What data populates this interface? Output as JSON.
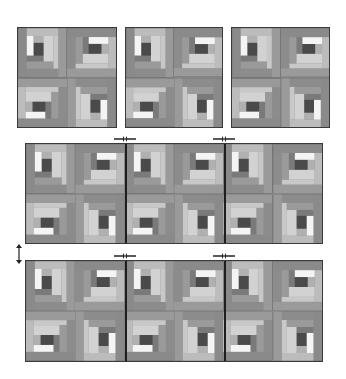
{
  "diagram": {
    "title": "",
    "colors": {
      "center": "#4a4a4a",
      "white": "#f4f4f4",
      "light": "#cfcfcf",
      "mid_light": "#b4b4b4",
      "mid": "#9c9c9c",
      "mid_dark": "#868686",
      "dark": "#767676",
      "border": "#3a3a3a"
    },
    "top_units": [
      {
        "id": "unit-1",
        "blocks": [
          0,
          90,
          270,
          180
        ]
      },
      {
        "id": "unit-2",
        "blocks": [
          0,
          90,
          270,
          180
        ]
      },
      {
        "id": "unit-3",
        "blocks": [
          0,
          90,
          270,
          180
        ]
      }
    ],
    "strips": [
      {
        "id": "strip-middle",
        "rows": [
          [
            0,
            90,
            0,
            90,
            0,
            90
          ],
          [
            270,
            180,
            270,
            180,
            270,
            180
          ]
        ]
      },
      {
        "id": "strip-bottom",
        "rows": [
          [
            0,
            90,
            0,
            90,
            0,
            90
          ],
          [
            270,
            180,
            270,
            180,
            270,
            180
          ]
        ]
      }
    ],
    "join_arrows": [
      {
        "id": "arrow-middle-left-seam",
        "direction": "horizontal-converging"
      },
      {
        "id": "arrow-middle-right-seam",
        "direction": "horizontal-converging"
      },
      {
        "id": "arrow-bottom-left-seam",
        "direction": "horizontal-converging"
      },
      {
        "id": "arrow-bottom-right-seam",
        "direction": "horizontal-converging"
      },
      {
        "id": "arrow-strips-vertical",
        "direction": "vertical-double"
      }
    ]
  }
}
